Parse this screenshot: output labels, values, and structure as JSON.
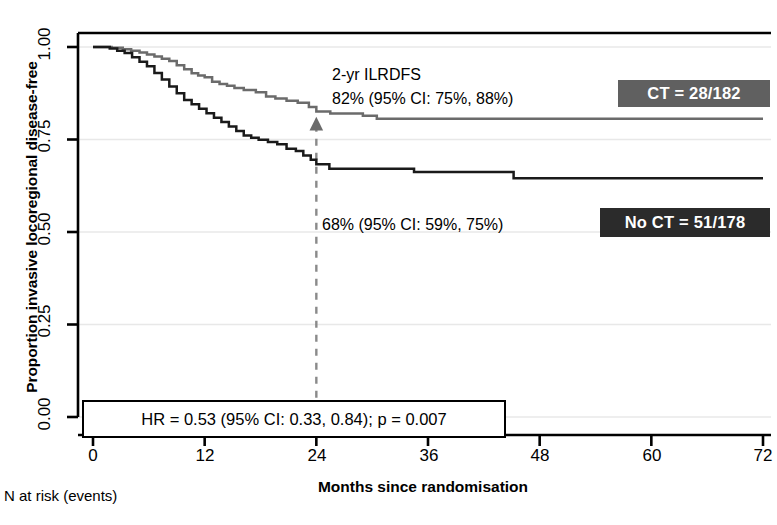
{
  "chart_data": {
    "type": "line",
    "subtype": "kaplan-meier-survival",
    "title": "",
    "xlabel": "Months since randomisation",
    "ylabel": "Proportion invasive locoregional disease-free",
    "xlim": [
      0,
      72
    ],
    "ylim": [
      0.0,
      1.0
    ],
    "xticks": [
      0,
      12,
      24,
      36,
      48,
      60,
      72
    ],
    "xticklabels": [
      "0",
      "12",
      "24",
      "36",
      "48",
      "60",
      "72"
    ],
    "yticks": [
      0.0,
      0.25,
      0.5,
      0.75,
      1.0
    ],
    "yticklabels": [
      "0.00",
      "0.25",
      "0.50",
      "0.75",
      "1.00"
    ],
    "grid": "horizontal-light",
    "legend_position": "right-inside",
    "series": [
      {
        "name": "CT = 28/182",
        "color": "#6b6b6b",
        "events": 28,
        "n": 182,
        "two_year_estimate": 0.82,
        "two_year_ci": [
          0.75,
          0.88
        ],
        "steps": [
          [
            0.0,
            1.0
          ],
          [
            2.0,
            0.998
          ],
          [
            3.2,
            0.994
          ],
          [
            4.1,
            0.99
          ],
          [
            5.0,
            0.985
          ],
          [
            5.8,
            0.98
          ],
          [
            6.6,
            0.974
          ],
          [
            7.4,
            0.968
          ],
          [
            8.2,
            0.962
          ],
          [
            9.0,
            0.951
          ],
          [
            9.8,
            0.94
          ],
          [
            10.6,
            0.929
          ],
          [
            11.3,
            0.923
          ],
          [
            12.0,
            0.918
          ],
          [
            12.8,
            0.906
          ],
          [
            13.6,
            0.9
          ],
          [
            14.4,
            0.895
          ],
          [
            15.2,
            0.889
          ],
          [
            16.2,
            0.884
          ],
          [
            17.5,
            0.878
          ],
          [
            18.6,
            0.866
          ],
          [
            19.6,
            0.861
          ],
          [
            20.8,
            0.855
          ],
          [
            22.0,
            0.849
          ],
          [
            23.2,
            0.838
          ],
          [
            24.0,
            0.826
          ],
          [
            25.5,
            0.82
          ],
          [
            27.0,
            0.82
          ],
          [
            29.0,
            0.814
          ],
          [
            30.5,
            0.806
          ],
          [
            72.0,
            0.806
          ]
        ]
      },
      {
        "name": "No CT = 51/178",
        "color": "#1a1a1a",
        "events": 51,
        "n": 178,
        "two_year_estimate": 0.68,
        "two_year_ci": [
          0.59,
          0.75
        ],
        "steps": [
          [
            0.0,
            1.0
          ],
          [
            1.8,
            0.996
          ],
          [
            2.6,
            0.99
          ],
          [
            3.4,
            0.984
          ],
          [
            4.2,
            0.972
          ],
          [
            5.0,
            0.96
          ],
          [
            5.8,
            0.948
          ],
          [
            6.6,
            0.93
          ],
          [
            7.4,
            0.912
          ],
          [
            8.2,
            0.893
          ],
          [
            9.0,
            0.875
          ],
          [
            9.8,
            0.857
          ],
          [
            10.6,
            0.845
          ],
          [
            11.4,
            0.833
          ],
          [
            12.2,
            0.821
          ],
          [
            13.0,
            0.809
          ],
          [
            13.8,
            0.797
          ],
          [
            14.6,
            0.785
          ],
          [
            15.4,
            0.773
          ],
          [
            16.2,
            0.761
          ],
          [
            17.0,
            0.755
          ],
          [
            17.8,
            0.749
          ],
          [
            18.8,
            0.743
          ],
          [
            19.8,
            0.737
          ],
          [
            20.8,
            0.725
          ],
          [
            21.8,
            0.719
          ],
          [
            22.6,
            0.707
          ],
          [
            23.4,
            0.695
          ],
          [
            24.0,
            0.683
          ],
          [
            25.4,
            0.671
          ],
          [
            33.5,
            0.671
          ],
          [
            34.5,
            0.662
          ],
          [
            44.0,
            0.662
          ],
          [
            45.2,
            0.645
          ],
          [
            72.0,
            0.645
          ]
        ]
      }
    ],
    "marker": {
      "name": "two-year-marker",
      "x": 24,
      "y": 0.79,
      "shape": "triangle-up",
      "color": "#6b6b6b"
    },
    "reference_line": {
      "name": "two-year-reference",
      "x": 24,
      "style": "dashed",
      "color": "#8a8a8a",
      "y_from": 0.0,
      "y_to": 0.79
    },
    "annotations": {
      "heading": "2-yr ILRDFS",
      "ct_estimate": "82% (95% CI: 75%,  88%)",
      "noct_estimate": "68% (95% CI: 59%, 75%)",
      "hazard_ratio": "HR = 0.53 (95% CI: 0.33, 0.84); p = 0.007"
    },
    "footnote": "N at risk (events)"
  },
  "legend": {
    "ct_label": "CT = 28/182",
    "noct_label": "No CT = 51/178",
    "ct_color": "#606060",
    "noct_color": "#2b2b2b"
  }
}
